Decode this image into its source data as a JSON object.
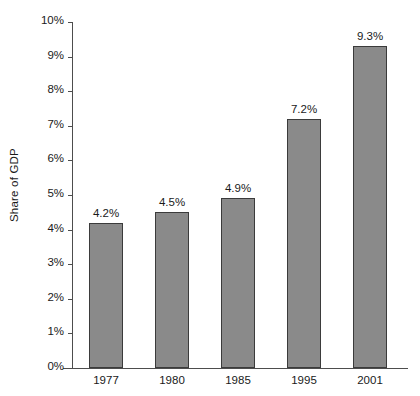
{
  "chart_data": {
    "type": "bar",
    "title": "",
    "subtitle": "",
    "xlabel": "",
    "ylabel": "Share of GDP",
    "categories": [
      "1977",
      "1980",
      "1985",
      "1995",
      "2001"
    ],
    "values": [
      4.2,
      4.5,
      4.9,
      7.2,
      9.3
    ],
    "value_labels": [
      "4.2%",
      "4.5%",
      "4.9%",
      "7.2%",
      "9.3%"
    ],
    "ylim": [
      0,
      10
    ],
    "y_tick_values": [
      0,
      1,
      2,
      3,
      4,
      5,
      6,
      7,
      8,
      9,
      10
    ],
    "y_tick_labels": [
      "0%",
      "1%",
      "2%",
      "3%",
      "4%",
      "5%",
      "6%",
      "7%",
      "8%",
      "9%",
      "10%"
    ],
    "grid": false,
    "legend": false,
    "legend_position": "none",
    "units": "percent",
    "series": [
      {
        "name": "Share of GDP",
        "values": [
          4.2,
          4.5,
          4.9,
          7.2,
          9.3
        ]
      }
    ]
  },
  "style": {
    "background_color": "#ffffff",
    "bar_fill_color": "#8a8a8a",
    "bar_border_color": "#3b3b3b",
    "axis_color": "#4d4d4d",
    "text_color": "#1a1a1a"
  }
}
